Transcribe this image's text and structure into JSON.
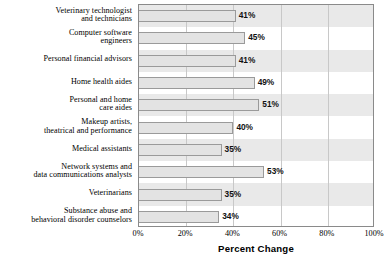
{
  "chart_data": {
    "type": "bar",
    "orientation": "horizontal",
    "title": "",
    "xlabel": "Percent Change",
    "ylabel": "",
    "xlim": [
      0,
      100
    ],
    "xticks": [
      "0%",
      "20%",
      "40%",
      "60%",
      "80%",
      "100%"
    ],
    "xtick_values": [
      0,
      20,
      40,
      60,
      80,
      100
    ],
    "grid": "vertical",
    "legend": "none",
    "categories": [
      "Veterinary technologist and technicians",
      "Computer software engineers",
      "Personal financial advisors",
      "Home health aides",
      "Personal and home care aides",
      "Makeup artists, theatrical and performance",
      "Medical assistants",
      "Network systems and data communications analysts",
      "Veterinarians",
      "Substance abuse and behavioral disorder counselors"
    ],
    "category_lines": [
      [
        "Veterinary technologist",
        "and technicians"
      ],
      [
        "Computer software",
        "engineers"
      ],
      [
        "Personal financial advisors"
      ],
      [
        "Home health aides"
      ],
      [
        "Personal and home",
        "care aides"
      ],
      [
        "Makeup artists,",
        "theatrical and performance"
      ],
      [
        "Medical assistants"
      ],
      [
        "Network systems and",
        "data communications analysts"
      ],
      [
        "Veterinarians"
      ],
      [
        "Substance abuse and",
        "behavioral disorder counselors"
      ]
    ],
    "values": [
      41,
      45,
      41,
      49,
      51,
      40,
      35,
      53,
      35,
      34
    ],
    "value_labels": [
      "41%",
      "45%",
      "41%",
      "49%",
      "51%",
      "40%",
      "35%",
      "53%",
      "35%",
      "34%"
    ],
    "colors": {
      "bar_fill": "#e3e3e3",
      "bar_border": "#9a9a9a",
      "band_shaded": "#e9e9e9",
      "band_plain": "#ffffff",
      "gridline": "#c8c8c8",
      "axis": "#8a8a8a",
      "text": "#000000"
    }
  }
}
